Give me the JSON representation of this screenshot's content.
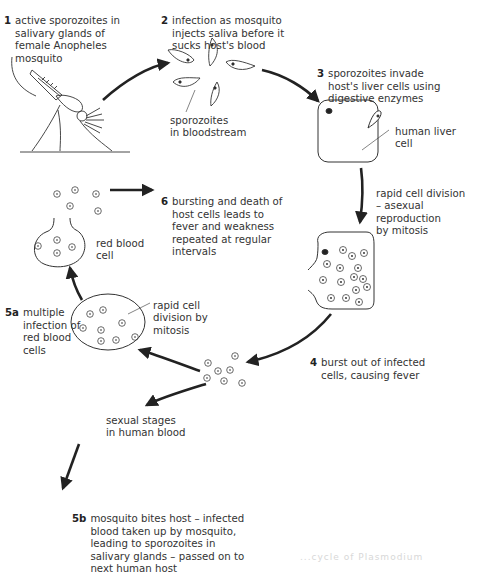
{
  "diagram": {
    "steps": [
      {
        "id": "1",
        "text": "active sporozoites in\nsalivary glands of\nfemale Anopheles\nmosquito"
      },
      {
        "id": "2",
        "text": "infection as mosquito\ninjects saliva before it\nsucks host's blood"
      },
      {
        "id": "3",
        "text": "sporozoites invade\nhost's liver cells using\ndigestive enzymes"
      },
      {
        "id": "4",
        "text": "burst out of infected\ncells, causing fever"
      },
      {
        "id": "5a",
        "text": "multiple\ninfection of\nred blood\ncells"
      },
      {
        "id": "5b",
        "text": "mosquito bites host – infected\nblood taken up by mosquito,\nleading to sporozoites in\nsalivary glands – passed on to\nnext human host"
      },
      {
        "id": "6",
        "text": "bursting and death of\nhost cells leads to\nfever and weakness\nrepeated at regular\nintervals"
      }
    ],
    "labels": {
      "sporozoites_bloodstream": "sporozoites\nin bloodstream",
      "human_liver_cell": "human liver\ncell",
      "rapid_division_asexual": "rapid cell division\n– asexual reproduction\nby mitosis",
      "red_blood_cell": "red blood\ncell",
      "rapid_division_mitosis": "rapid cell\ndivision by\nmitosis",
      "sexual_stages": "sexual stages\nin human blood"
    },
    "footer_caption": "...cycle of Plasmodium"
  }
}
